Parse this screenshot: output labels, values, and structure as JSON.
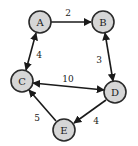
{
  "diagram": {
    "type": "directed-weighted-graph",
    "nodes": [
      {
        "id": "A",
        "label": "A",
        "x": 40,
        "y": 22
      },
      {
        "id": "B",
        "label": "B",
        "x": 103,
        "y": 22
      },
      {
        "id": "C",
        "label": "C",
        "x": 22,
        "y": 81
      },
      {
        "id": "D",
        "label": "D",
        "x": 115,
        "y": 92
      },
      {
        "id": "E",
        "label": "E",
        "x": 64,
        "y": 130
      }
    ],
    "edges": [
      {
        "from": "A",
        "to": "B",
        "weight": "2",
        "bidirectional": false
      },
      {
        "from": "A",
        "to": "C",
        "weight": "4",
        "bidirectional": true
      },
      {
        "from": "B",
        "to": "D",
        "weight": "3",
        "bidirectional": true
      },
      {
        "from": "C",
        "to": "D",
        "weight": "10",
        "bidirectional": true
      },
      {
        "from": "D",
        "to": "E",
        "weight": "4",
        "bidirectional": false
      },
      {
        "from": "E",
        "to": "C",
        "weight": "5",
        "bidirectional": false
      }
    ],
    "colors": {
      "node_fill": "#d6d6d6",
      "node_stroke": "#2a2a2a",
      "edge": "#1a1a1a"
    }
  }
}
